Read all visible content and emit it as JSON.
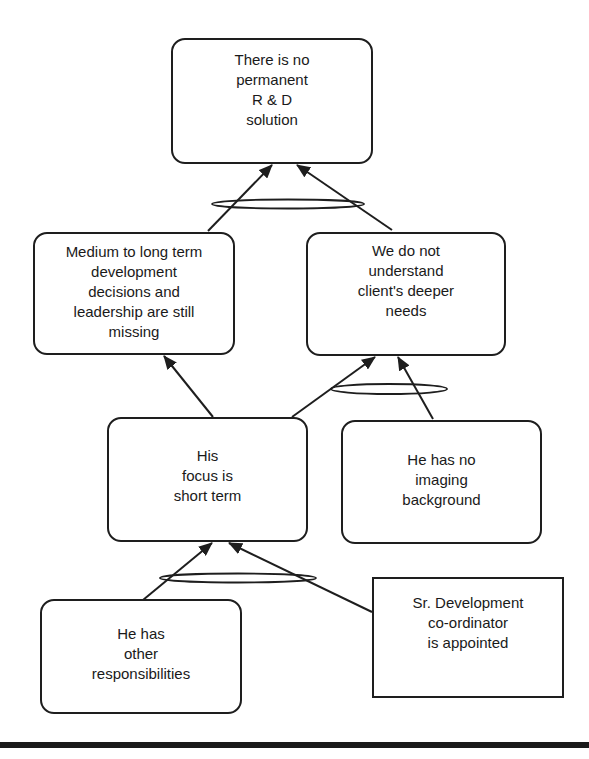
{
  "diagram": {
    "type": "current reality tree",
    "colors": {
      "stroke": "#1e1e1e",
      "background": "#ffffff",
      "rule": "#1a1a1a"
    },
    "nodes": {
      "top": {
        "lines": [
          "There is no",
          "permanent",
          "R & D",
          "solution"
        ],
        "shape": "rounded"
      },
      "mid_left": {
        "lines": [
          "Medium to long term",
          "development",
          "decisions and",
          "leadership are still",
          "missing"
        ],
        "shape": "rounded"
      },
      "mid_right": {
        "lines": [
          "We do not",
          "understand",
          "client's deeper",
          "needs"
        ],
        "shape": "rounded"
      },
      "focus": {
        "lines": [
          "His",
          "focus is",
          "short term"
        ],
        "shape": "rounded"
      },
      "imaging": {
        "lines": [
          "He has no",
          "imaging",
          "background"
        ],
        "shape": "rounded"
      },
      "responsibilities": {
        "lines": [
          "He has",
          "other",
          "responsibilities"
        ],
        "shape": "rounded"
      },
      "appointed": {
        "lines": [
          "Sr. Development",
          "co-ordinator",
          "is appointed"
        ],
        "shape": "square"
      }
    },
    "edges": [
      {
        "from": "mid_left",
        "to": "top",
        "and_group": "top-and"
      },
      {
        "from": "mid_right",
        "to": "top",
        "and_group": "top-and"
      },
      {
        "from": "focus",
        "to": "mid_left"
      },
      {
        "from": "focus",
        "to": "mid_right",
        "and_group": "mid-right-and"
      },
      {
        "from": "imaging",
        "to": "mid_right",
        "and_group": "mid-right-and"
      },
      {
        "from": "responsibilities",
        "to": "focus",
        "and_group": "focus-and"
      },
      {
        "from": "appointed",
        "to": "focus",
        "and_group": "focus-and"
      }
    ]
  }
}
